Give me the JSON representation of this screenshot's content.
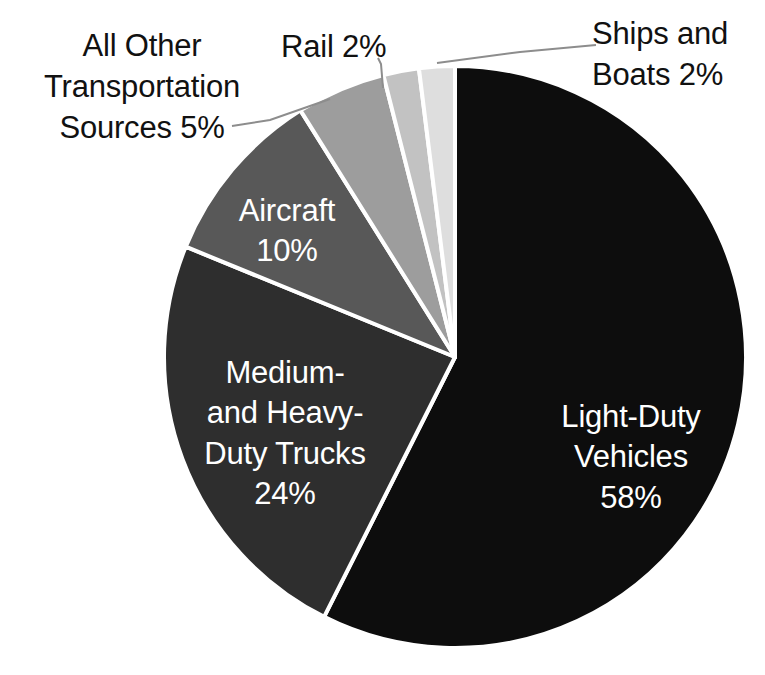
{
  "chart_data": {
    "type": "pie",
    "title": "",
    "subtitle": "",
    "xlabel": "",
    "ylabel": "",
    "legend_position": "none",
    "grid": false,
    "units": "percent",
    "categories": [
      "Light-Duty Vehicles",
      "Medium- and Heavy-Duty Trucks",
      "Aircraft",
      "All Other Transportation Sources",
      "Rail",
      "Ships and Boats"
    ],
    "values": [
      58,
      24,
      10,
      5,
      2,
      2
    ],
    "value_labels": [
      "58%",
      "24%",
      "10%",
      "5%",
      "2%",
      "2%"
    ],
    "colors": [
      "#0d0d0d",
      "#2e2e2e",
      "#585858",
      "#9d9d9d",
      "#c2c2c2",
      "#dedede"
    ],
    "slice_label_placement": [
      "inside",
      "inside",
      "inside",
      "outside",
      "outside",
      "outside"
    ],
    "slices": [
      {
        "name": "Light-Duty Vehicles",
        "value": 58,
        "value_label": "58%",
        "label_text": "Light-Duty\nVehicles\n58%",
        "color": "#0d0d0d",
        "label_color": "#ffffff",
        "placement": "inside"
      },
      {
        "name": "Medium- and Heavy-Duty Trucks",
        "value": 24,
        "value_label": "24%",
        "label_text": "Medium-\nand Heavy-\nDuty Trucks\n24%",
        "color": "#2e2e2e",
        "label_color": "#ffffff",
        "placement": "inside"
      },
      {
        "name": "Aircraft",
        "value": 10,
        "value_label": "10%",
        "label_text": "Aircraft\n10%",
        "color": "#585858",
        "label_color": "#ffffff",
        "placement": "inside"
      },
      {
        "name": "All Other Transportation Sources",
        "value": 5,
        "value_label": "5%",
        "label_text": "All Other\nTransportation\nSources 5%",
        "color": "#9d9d9d",
        "label_color": "#111111",
        "placement": "outside"
      },
      {
        "name": "Rail",
        "value": 2,
        "value_label": "2%",
        "label_text": "Rail 2%",
        "color": "#c2c2c2",
        "label_color": "#111111",
        "placement": "outside"
      },
      {
        "name": "Ships and Boats",
        "value": 2,
        "value_label": "2%",
        "label_text": "Ships and\nBoats 2%",
        "color": "#dedede",
        "label_color": "#111111",
        "placement": "outside"
      }
    ]
  },
  "labels": {
    "all_other": "All Other\nTransportation\nSources 5%",
    "rail": "Rail 2%",
    "ships": "Ships and\nBoats 2%",
    "aircraft": "Aircraft\n10%",
    "trucks": "Medium-\nand Heavy-\nDuty Trucks\n24%",
    "light_duty": "Light-Duty\nVehicles\n58%"
  },
  "geometry": {
    "center_x": 455,
    "center_y": 357,
    "radius": 291,
    "start_angle_deg": -90,
    "separator_color": "#ffffff",
    "separator_width": 4,
    "background": "#ffffff"
  }
}
